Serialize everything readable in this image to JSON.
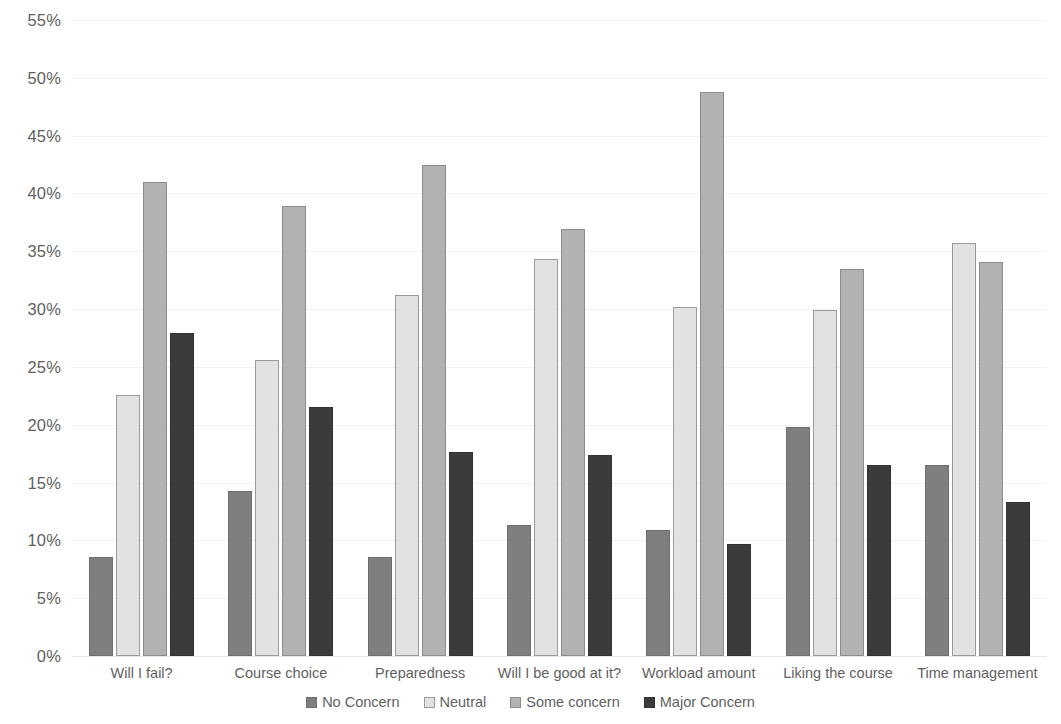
{
  "chart_data": {
    "type": "bar",
    "title": "",
    "subtitle": "",
    "xlabel": "",
    "ylabel": "",
    "ylim": [
      0,
      55
    ],
    "ytick_step": 5,
    "ytick_labels": [
      "0%",
      "5%",
      "10%",
      "15%",
      "20%",
      "25%",
      "30%",
      "35%",
      "40%",
      "45%",
      "50%",
      "55%"
    ],
    "ytick_values": [
      0,
      5,
      10,
      15,
      20,
      25,
      30,
      35,
      40,
      45,
      50,
      55
    ],
    "grid": true,
    "legend_position": "bottom",
    "grouping": "grouped",
    "categories": [
      "Will I fail?",
      "Course choice",
      "Preparedness",
      "Will I be good at it?",
      "Workload amount",
      "Liking the course",
      "Time management"
    ],
    "series": [
      {
        "name": "No Concern",
        "color": "#7f7f7f",
        "values": [
          8.6,
          14.3,
          8.6,
          11.3,
          10.9,
          19.8,
          16.5
        ]
      },
      {
        "name": "Neutral",
        "color": "#e2e2e2",
        "values": [
          22.6,
          25.6,
          31.2,
          34.3,
          30.2,
          29.9,
          35.7
        ]
      },
      {
        "name": "Some concern",
        "color": "#b2b2b2",
        "values": [
          41.0,
          38.9,
          42.5,
          36.9,
          48.8,
          33.5,
          34.1
        ]
      },
      {
        "name": "Major Concern",
        "color": "#3b3b3b",
        "values": [
          27.9,
          21.5,
          17.6,
          17.4,
          9.7,
          16.5,
          13.3
        ]
      }
    ]
  },
  "legend": {
    "items": [
      {
        "label": "No Concern"
      },
      {
        "label": "Neutral"
      },
      {
        "label": "Some concern"
      },
      {
        "label": "Major Concern"
      }
    ]
  }
}
